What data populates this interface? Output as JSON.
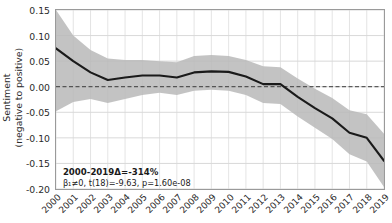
{
  "chart_data": {
    "type": "line",
    "title": "",
    "xlabel": "",
    "ylabel": "Sentiment (negative to positive)",
    "ylabel_line1": "Sentiment",
    "ylabel_line2": "(negative to positive)",
    "grid": true,
    "legend": "none",
    "xlim": [
      2000,
      2019
    ],
    "ylim": [
      -0.2,
      0.15
    ],
    "yticks": [
      0.15,
      0.1,
      0.05,
      0.0,
      -0.05,
      -0.1,
      -0.15,
      -0.2
    ],
    "ytick_labels": [
      "0.15",
      "0.10",
      "0.05",
      "0.00",
      "-0.05",
      "-0.10",
      "-0.15",
      "-0.20"
    ],
    "categories": [
      2000,
      2001,
      2002,
      2003,
      2004,
      2005,
      2006,
      2007,
      2008,
      2009,
      2010,
      2011,
      2012,
      2013,
      2014,
      2015,
      2016,
      2017,
      2018,
      2019
    ],
    "xtick_labels": [
      "2000",
      "2001",
      "2002",
      "2003",
      "2004",
      "2005",
      "2006",
      "2007",
      "2008",
      "2009",
      "2010",
      "2011",
      "2012",
      "2013",
      "2014",
      "2015",
      "2016",
      "2017",
      "2018",
      "2019"
    ],
    "series": [
      {
        "name": "Sentiment",
        "values": [
          0.075,
          0.05,
          0.028,
          0.013,
          0.018,
          0.022,
          0.022,
          0.018,
          0.028,
          0.03,
          0.029,
          0.02,
          0.005,
          0.005,
          -0.02,
          -0.042,
          -0.062,
          -0.09,
          -0.1,
          -0.145
        ],
        "color": "#1a1a1a"
      }
    ],
    "confidence_band": {
      "name": "95% CI",
      "color": "#b8b8b8",
      "upper": [
        0.15,
        0.1,
        0.072,
        0.055,
        0.052,
        0.052,
        0.05,
        0.048,
        0.06,
        0.062,
        0.06,
        0.052,
        0.04,
        0.038,
        0.016,
        -0.004,
        -0.022,
        -0.046,
        -0.054,
        -0.092
      ],
      "lower": [
        -0.048,
        -0.03,
        -0.024,
        -0.032,
        -0.024,
        -0.016,
        -0.012,
        -0.016,
        -0.008,
        -0.006,
        -0.008,
        -0.016,
        -0.032,
        -0.034,
        -0.058,
        -0.08,
        -0.102,
        -0.132,
        -0.146,
        -0.196
      ]
    },
    "reference_line": {
      "name": "zero-line",
      "y": 0.0,
      "style": "dashed",
      "color": "#3a3a3a"
    },
    "annotations": [
      {
        "name": "delta-annotation",
        "text": "2000-2019Δ=-314%",
        "x": 2000.4,
        "y": -0.168
      },
      {
        "name": "stat-annotation",
        "text": "β₁≠0, t(18)=-9.63, p=1.60e-08",
        "x": 2000.4,
        "y": -0.19
      }
    ]
  },
  "colors": {
    "line": "#1a1a1a",
    "band": "#b8b8b8",
    "grid": "#d9d9d9",
    "frame": "#9a9a9a",
    "text": "#2b2b2b",
    "background": "#ffffff"
  }
}
